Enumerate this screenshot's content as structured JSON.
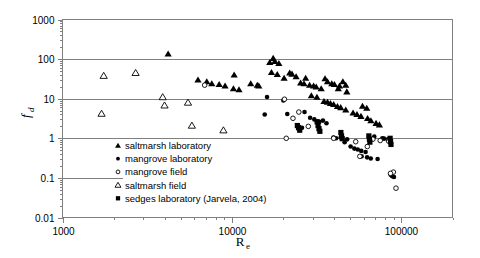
{
  "chart_data": {
    "type": "scatter",
    "title": "",
    "xlabel": "Re",
    "ylabel": "fd",
    "xscale": "log",
    "yscale": "log",
    "xlim": [
      1000,
      200000
    ],
    "ylim": [
      0.01,
      1000
    ],
    "xticks": [
      1000,
      10000,
      100000
    ],
    "xtick_labels": [
      "1000",
      "10000",
      "100000"
    ],
    "yticks": [
      0.01,
      0.1,
      1,
      10,
      100,
      1000
    ],
    "ytick_labels": [
      "0.01",
      "0.1",
      "1",
      "10",
      "100",
      "1000"
    ],
    "grid": "horizontal gridlines at 100, 10, 1, 0.1",
    "legend_position": "inside lower-left",
    "series": [
      {
        "name": "saltmarsh laboratory",
        "marker": "filled-triangle",
        "color": "#000000",
        "points": [
          [
            4200,
            135
          ],
          [
            10300,
            40
          ],
          [
            12900,
            24
          ],
          [
            14100,
            22
          ],
          [
            14400,
            21
          ],
          [
            16700,
            83
          ],
          [
            6300,
            30
          ],
          [
            7100,
            27
          ],
          [
            7600,
            24
          ],
          [
            8400,
            23
          ],
          [
            9100,
            21
          ],
          [
            10200,
            18
          ],
          [
            11000,
            17
          ],
          [
            17500,
            105
          ],
          [
            17900,
            88
          ],
          [
            18900,
            78
          ],
          [
            17100,
            46
          ],
          [
            18500,
            41
          ],
          [
            20300,
            33
          ],
          [
            21900,
            45
          ],
          [
            22600,
            42
          ],
          [
            23900,
            36
          ],
          [
            27200,
            33
          ],
          [
            25400,
            25
          ],
          [
            26600,
            24
          ],
          [
            28700,
            22
          ],
          [
            30300,
            21
          ],
          [
            31400,
            20
          ],
          [
            33600,
            18
          ],
          [
            35400,
            32
          ],
          [
            36600,
            27
          ],
          [
            38800,
            24
          ],
          [
            40200,
            23
          ],
          [
            43100,
            21
          ],
          [
            45100,
            27
          ],
          [
            46900,
            22
          ],
          [
            42400,
            18
          ],
          [
            47600,
            15
          ],
          [
            29400,
            12
          ],
          [
            31700,
            11
          ],
          [
            34900,
            8.6
          ],
          [
            36600,
            8.2
          ],
          [
            38100,
            7.6
          ],
          [
            39800,
            7.2
          ],
          [
            41900,
            6.4
          ],
          [
            43800,
            6.0
          ],
          [
            46900,
            5.2
          ],
          [
            51800,
            4.4
          ],
          [
            54600,
            4.0
          ],
          [
            57700,
            3.6
          ],
          [
            63100,
            3.2
          ],
          [
            66000,
            2.8
          ],
          [
            58900,
            6.5
          ],
          [
            62400,
            5.8
          ],
          [
            70800,
            2.4
          ],
          [
            74100,
            2.2
          ]
        ]
      },
      {
        "name": "mangrove laboratory",
        "marker": "filled-circle",
        "color": "#000000",
        "points": [
          [
            16100,
            11
          ],
          [
            15600,
            4.0
          ],
          [
            20100,
            9.0
          ],
          [
            21200,
            4.1
          ],
          [
            26800,
            4.6
          ],
          [
            28900,
            3.3
          ],
          [
            30600,
            3.0
          ],
          [
            31700,
            2.7
          ],
          [
            32800,
            2.6
          ],
          [
            34400,
            2.8
          ],
          [
            36100,
            2.4
          ],
          [
            39700,
            1.05
          ],
          [
            41100,
            1.0
          ],
          [
            43800,
            1.05
          ],
          [
            46200,
            0.8
          ],
          [
            50100,
            0.62
          ],
          [
            52700,
            0.55
          ],
          [
            55200,
            0.52
          ],
          [
            57900,
            0.48
          ],
          [
            61400,
            0.45
          ],
          [
            58200,
            0.35
          ],
          [
            62700,
            0.33
          ],
          [
            65900,
            0.31
          ],
          [
            72300,
            0.3
          ],
          [
            77100,
            1.0
          ],
          [
            78900,
            0.98
          ],
          [
            83200,
            0.95
          ],
          [
            86300,
            0.12
          ],
          [
            88100,
            0.11
          ],
          [
            90300,
            0.105
          ],
          [
            24800,
            1.95
          ],
          [
            25900,
            1.85
          ],
          [
            44600,
            0.96
          ],
          [
            47800,
            0.94
          ],
          [
            69100,
            1.1
          ]
        ]
      },
      {
        "name": "mangrove field",
        "marker": "open-circle",
        "color": "#000000",
        "points": [
          [
            6900,
            22
          ],
          [
            20400,
            9.7
          ],
          [
            24800,
            4.6
          ],
          [
            22900,
            3.2
          ],
          [
            28200,
            2.0
          ],
          [
            39800,
            1.0
          ],
          [
            53700,
            0.82
          ],
          [
            62900,
            0.62
          ],
          [
            67800,
            0.95
          ],
          [
            74900,
            0.88
          ],
          [
            83900,
            0.85
          ],
          [
            89600,
            0.14
          ],
          [
            86100,
            0.13
          ],
          [
            92800,
            0.055
          ],
          [
            56800,
            0.35
          ],
          [
            20900,
            1.0
          ]
        ]
      },
      {
        "name": "saltmarsh field",
        "marker": "open-triangle",
        "color": "#000000",
        "points": [
          [
            1750,
            38
          ],
          [
            1700,
            4.2
          ],
          [
            2700,
            45
          ],
          [
            3900,
            11
          ],
          [
            4000,
            6.8
          ],
          [
            5500,
            8.0
          ],
          [
            5800,
            2.1
          ],
          [
            8900,
            1.6
          ]
        ]
      },
      {
        "name": "sedges laboratory (Jarvela, 2004)",
        "marker": "filled-square",
        "color": "#000000",
        "points": [
          [
            31800,
            2.6
          ],
          [
            32200,
            2.1
          ],
          [
            32600,
            1.75
          ],
          [
            33000,
            1.5
          ],
          [
            43900,
            1.4
          ],
          [
            44300,
            1.15
          ],
          [
            44700,
            0.98
          ],
          [
            64200,
            1.15
          ],
          [
            64700,
            0.95
          ],
          [
            65100,
            0.8
          ],
          [
            85700,
            1.0
          ],
          [
            86200,
            0.82
          ],
          [
            86700,
            0.7
          ],
          [
            24300,
            2.1
          ],
          [
            24700,
            1.85
          ],
          [
            25100,
            1.6
          ]
        ]
      }
    ]
  },
  "axes": {
    "y_title_main": "f",
    "y_title_sub": "d",
    "x_title_main": "R",
    "x_title_sub": "e"
  },
  "legend": {
    "items": [
      {
        "label": "saltmarsh laboratory",
        "marker": "filled-triangle"
      },
      {
        "label": "mangrove laboratory",
        "marker": "filled-circle"
      },
      {
        "label": "mangrove field",
        "marker": "open-circle"
      },
      {
        "label": "saltmarsh field",
        "marker": "open-triangle"
      },
      {
        "label": "sedges laboratory (Jarvela, 2004)",
        "marker": "filled-square"
      }
    ]
  }
}
